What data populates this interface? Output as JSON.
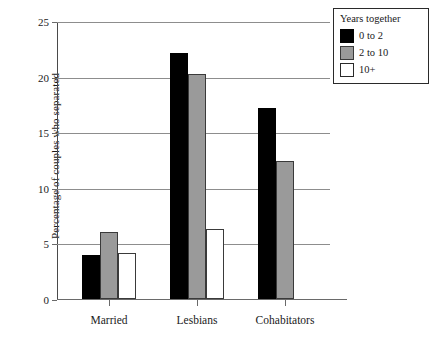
{
  "chart_data": {
    "type": "bar",
    "title": "",
    "xlabel": "",
    "ylabel": "Percentage of couples who separated",
    "categories": [
      "Married",
      "Lesbians",
      "Cohabitators"
    ],
    "series": [
      {
        "name": "0 to 2",
        "color": "#000000",
        "values": [
          4.0,
          22.1,
          17.2
        ]
      },
      {
        "name": "2 to 10",
        "color": "#9a9a9a",
        "values": [
          6.0,
          20.2,
          12.4
        ]
      },
      {
        "name": "10+",
        "color": "#ffffff",
        "values": [
          4.1,
          6.3,
          null
        ]
      }
    ],
    "ylim": [
      0,
      25
    ],
    "yticks": [
      0,
      5,
      10,
      15,
      20,
      25
    ],
    "ytick_labels": [
      "0",
      "5",
      "10",
      "15",
      "20",
      "25"
    ],
    "grid": true,
    "grid_axis": "y",
    "legend": {
      "title": "Years together",
      "position": "top-right",
      "entries": [
        "0 to 2",
        "2 to 10",
        "10+"
      ]
    }
  }
}
